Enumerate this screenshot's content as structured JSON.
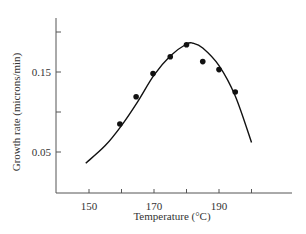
{
  "chart_data": {
    "type": "scatter",
    "title": "",
    "xlabel": "Temperature (°C)",
    "ylabel": "Growth rate (microns/min)",
    "xlim": [
      140,
      212
    ],
    "ylim": [
      0,
      0.22
    ],
    "x_ticks": [
      150,
      160,
      170,
      180,
      190,
      200
    ],
    "x_tick_labels": [
      "150",
      "",
      "170",
      "",
      "190",
      ""
    ],
    "y_ticks": [
      0.05,
      0.1,
      0.15,
      0.2
    ],
    "y_tick_labels": [
      "0.05",
      "",
      "0.15",
      ""
    ],
    "grid": false,
    "legend": null,
    "series": [
      {
        "name": "measured",
        "kind": "points",
        "x": [
          159.5,
          164.5,
          169.7,
          175,
          180,
          185,
          190,
          195
        ],
        "y": [
          0.085,
          0.119,
          0.148,
          0.169,
          0.184,
          0.163,
          0.153,
          0.125
        ]
      },
      {
        "name": "fit",
        "kind": "curve",
        "x": [
          149,
          155,
          160,
          165,
          170,
          175,
          180,
          182,
          185,
          190,
          195,
          200
        ],
        "y": [
          0.036,
          0.058,
          0.083,
          0.113,
          0.146,
          0.17,
          0.185,
          0.186,
          0.18,
          0.158,
          0.12,
          0.062
        ]
      }
    ]
  },
  "axes": {
    "x_title": "Temperature (°C)",
    "y_title": "Growth rate (microns/min)",
    "x_labels": [
      "150",
      "170",
      "190"
    ],
    "y_labels": [
      "0.15",
      "0.05"
    ]
  },
  "colors": {
    "axis": "#555555",
    "curve": "#111111",
    "points": "#111111"
  }
}
